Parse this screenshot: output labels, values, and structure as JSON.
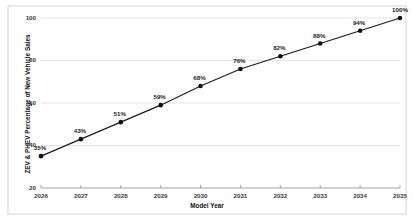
{
  "chart_data": {
    "type": "line",
    "title": "",
    "subtitle": "",
    "xlabel": "Model Year",
    "ylabel": "ZEV & PHEV Percentage of New Vehicle Sales",
    "categories": [
      "2026",
      "2027",
      "2028",
      "2029",
      "2030",
      "2031",
      "2032",
      "2033",
      "2034",
      "2035"
    ],
    "x": [
      2026,
      2027,
      2028,
      2029,
      2030,
      2031,
      2032,
      2033,
      2034,
      2035
    ],
    "values": [
      35,
      43,
      51,
      59,
      68,
      76,
      82,
      88,
      94,
      100
    ],
    "point_labels": [
      "35%",
      "43%",
      "51%",
      "59%",
      "68%",
      "76%",
      "82%",
      "88%",
      "94%",
      "100%"
    ],
    "series": [
      {
        "name": "ZEV & PHEV Percentage of New Vehicle Sales",
        "values": [
          35,
          43,
          51,
          59,
          68,
          76,
          82,
          88,
          94,
          100
        ]
      }
    ],
    "ylim": [
      20,
      100
    ],
    "xlim": [
      2026,
      2035
    ],
    "yticks": [
      20,
      40,
      60,
      80,
      100
    ],
    "ytick_labels": [
      "20",
      "40",
      "60",
      "80",
      "100"
    ],
    "xticks": [
      2026,
      2027,
      2028,
      2029,
      2030,
      2031,
      2032,
      2033,
      2034,
      2035
    ],
    "grid": "horizontal",
    "legend": "none",
    "marker": "circle",
    "line_color": "#1a1a1a",
    "marker_color": "#111111",
    "grid_color": "#d9d9d9",
    "axis_color": "#8a8a8a",
    "background": "#ffffff"
  }
}
